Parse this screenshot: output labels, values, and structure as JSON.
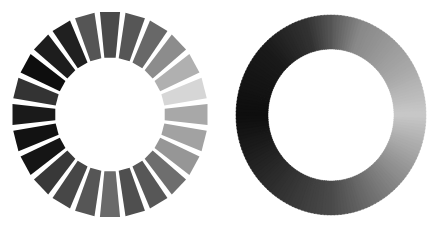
{
  "figure": {
    "description": "Two grayscale rings: a segmented ring and a continuous gradient ring",
    "background": "#ffffff"
  },
  "segmented_ring": {
    "cx": 110,
    "cy": 114.5,
    "outer_rx": 98,
    "outer_ry": 103,
    "inner_rx": 55,
    "inner_ry": 57,
    "segment_count": 24,
    "gap_degrees": 3.2,
    "start_angle_deg": 0,
    "segment_colors": [
      "#4a4a4a",
      "#565656",
      "#686868",
      "#8c8c8c",
      "#b0b0b0",
      "#d6d6d6",
      "#a8a8a8",
      "#a2a2a2",
      "#969696",
      "#6e6e6e",
      "#575757",
      "#4f4f4f",
      "#6a6a6a",
      "#565656",
      "#474747",
      "#383838",
      "#151515",
      "#121212",
      "#1a1a1a",
      "#333333",
      "#0e0e0e",
      "#1d1d1d",
      "#202020",
      "#555555"
    ]
  },
  "gradient_ring": {
    "cx": 331,
    "cy": 115,
    "outer_rx": 95,
    "outer_ry": 100,
    "inner_rx": 63,
    "inner_ry": 66,
    "steps": 180,
    "stops": [
      {
        "angle": 0,
        "color": "#555555"
      },
      {
        "angle": 20,
        "color": "#888888"
      },
      {
        "angle": 60,
        "color": "#a8a8a8"
      },
      {
        "angle": 90,
        "color": "#c8c8c8"
      },
      {
        "angle": 130,
        "color": "#8e8e8e"
      },
      {
        "angle": 180,
        "color": "#4a4a4a"
      },
      {
        "angle": 220,
        "color": "#2e2e2e"
      },
      {
        "angle": 270,
        "color": "#0e0e0e"
      },
      {
        "angle": 315,
        "color": "#1a1a1a"
      },
      {
        "angle": 345,
        "color": "#333333"
      },
      {
        "angle": 360,
        "color": "#555555"
      }
    ]
  }
}
